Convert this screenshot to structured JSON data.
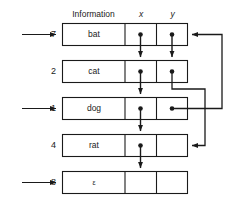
{
  "diagram": {
    "headers": {
      "information": "Information",
      "x": "x",
      "y": "y"
    },
    "colors": {
      "line": "#1a1a1a",
      "text": "#1a1a1a",
      "background": "#ffffff"
    },
    "rows": [
      {
        "index": "7",
        "information": "bat",
        "has_incoming_arrow": true,
        "x_pointer": true,
        "y_pointer": true
      },
      {
        "index": "2",
        "information": "cat",
        "has_incoming_arrow": false,
        "x_pointer": true,
        "y_pointer": true
      },
      {
        "index": "1",
        "information": "dog",
        "has_incoming_arrow": true,
        "x_pointer": true,
        "y_pointer": true
      },
      {
        "index": "4",
        "information": "rat",
        "has_incoming_arrow": false,
        "x_pointer": true,
        "y_pointer": false
      },
      {
        "index": "8",
        "information": "ε",
        "has_incoming_arrow": true,
        "x_pointer": false,
        "y_pointer": false
      }
    ]
  }
}
